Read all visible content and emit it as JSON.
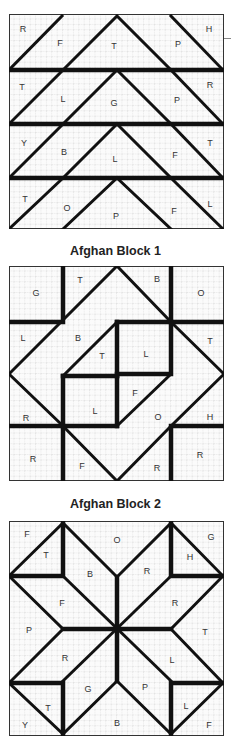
{
  "blocks": [
    {
      "caption": "Afghan Block 1",
      "rows": [
        [
          "R",
          "F",
          "T",
          "P",
          "H"
        ],
        [
          "T",
          "L",
          "G",
          "P",
          "R"
        ],
        [
          "Y",
          "B",
          "L",
          "F",
          "T"
        ],
        [
          "T",
          "O",
          "P",
          "F",
          "L"
        ]
      ]
    },
    {
      "caption": "Afghan Block 2",
      "labels": {
        "top_left": "G",
        "top_t": "T",
        "top_b": "B",
        "top_right": "O",
        "mid_l": "L",
        "mid_b": "B",
        "mid_t": "T",
        "center_l1": "L",
        "mid_right_t": "T",
        "center_l2": "L",
        "center_f": "F",
        "mid_o": "O",
        "mid_h": "H",
        "left_r": "R",
        "low_left_r": "R",
        "bottom_f": "F",
        "bottom_r": "R",
        "low_right_r": "R"
      }
    },
    {
      "caption": "",
      "labels": {
        "tl_f": "F",
        "tl_t": "T",
        "top_o": "O",
        "tr_h": "H",
        "tr_g": "G",
        "upper_b": "B",
        "upper_r": "R",
        "left_f": "F",
        "right_r": "R",
        "left_p": "P",
        "right_t": "T",
        "lower_r": "R",
        "lower_l": "L",
        "lower_g": "G",
        "lower_p": "P",
        "bl_t": "T",
        "bl_y": "Y",
        "bottom_b": "B",
        "br_l": "L",
        "br_f": "F"
      }
    }
  ]
}
